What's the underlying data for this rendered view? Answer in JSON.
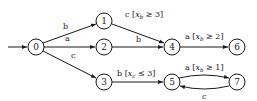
{
  "diagram": {
    "type": "state-machine",
    "colors": {
      "stroke": "#1a1a1a",
      "background": "#ffffff"
    },
    "initial_state": "0",
    "nodes": [
      {
        "id": "0",
        "label": "0",
        "x": 36,
        "y": 47
      },
      {
        "id": "1",
        "label": "1",
        "x": 104,
        "y": 21
      },
      {
        "id": "2",
        "label": "2",
        "x": 104,
        "y": 47
      },
      {
        "id": "3",
        "label": "3",
        "x": 104,
        "y": 82
      },
      {
        "id": "4",
        "label": "4",
        "x": 172,
        "y": 47
      },
      {
        "id": "5",
        "label": "5",
        "x": 172,
        "y": 82
      },
      {
        "id": "6",
        "label": "6",
        "x": 237,
        "y": 47
      },
      {
        "id": "7",
        "label": "7",
        "x": 237,
        "y": 82
      }
    ],
    "edges": [
      {
        "from": "0",
        "to": "1",
        "label": "b"
      },
      {
        "from": "0",
        "to": "2",
        "label": "a"
      },
      {
        "from": "0",
        "to": "3",
        "label": "c"
      },
      {
        "from": "1",
        "to": "4",
        "label": "c [x_b ≥ 3]",
        "symbol": "c",
        "guard_var": "x",
        "guard_sub": "b",
        "guard_op": "≥ 3"
      },
      {
        "from": "2",
        "to": "4",
        "label": "b"
      },
      {
        "from": "3",
        "to": "5",
        "label": "b [x_c ≤ 3]",
        "symbol": "b",
        "guard_var": "x",
        "guard_sub": "c",
        "guard_op": "≤ 3"
      },
      {
        "from": "4",
        "to": "6",
        "label": "a [x_b ≥ 2]",
        "symbol": "a",
        "guard_var": "x",
        "guard_sub": "b",
        "guard_op": "≥ 2"
      },
      {
        "from": "5",
        "to": "7",
        "label": "a [x_b ≥ 1]",
        "symbol": "a",
        "guard_var": "x",
        "guard_sub": "b",
        "guard_op": "≥ 1"
      },
      {
        "from": "7",
        "to": "5",
        "label": "c"
      }
    ]
  }
}
